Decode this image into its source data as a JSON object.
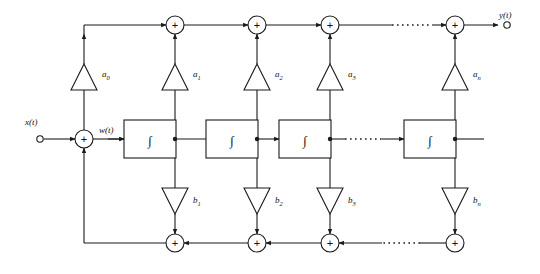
{
  "diagram": {
    "type": "signal-flow-block-diagram",
    "stroke_color": "#1a1a1a",
    "fill_color": "#ffffff",
    "background": "#ffffff",
    "width": 540,
    "height": 274
  },
  "terminals": {
    "input": {
      "label": "x(t)",
      "x": 36,
      "y": 139
    },
    "output": {
      "label": "y(t)",
      "x": 507,
      "y": 25
    },
    "internal": {
      "label": "w(t)",
      "x": 112,
      "y": 132
    }
  },
  "sum_symbol": "+",
  "integrator_symbol": "∫",
  "top_adders": [
    {
      "name": "adder-a0-a1",
      "x": 175,
      "y": 25
    },
    {
      "name": "adder-a1-a2",
      "x": 257,
      "y": 25
    },
    {
      "name": "adder-a2-a3",
      "x": 330,
      "y": 25
    },
    {
      "name": "adder-an",
      "x": 455,
      "y": 25
    }
  ],
  "bottom_adders": [
    {
      "name": "adder-b1",
      "x": 175,
      "y": 243
    },
    {
      "name": "adder-b2",
      "x": 257,
      "y": 243
    },
    {
      "name": "adder-b3",
      "x": 330,
      "y": 243
    },
    {
      "name": "adder-bn",
      "x": 455,
      "y": 243
    }
  ],
  "input_adder": {
    "name": "input-summing-junction",
    "x": 84,
    "y": 139
  },
  "integrators": [
    {
      "name": "integrator-1",
      "x": 150,
      "y": 139,
      "label": "∫"
    },
    {
      "name": "integrator-2",
      "x": 232,
      "y": 139,
      "label": "∫"
    },
    {
      "name": "integrator-3",
      "x": 305,
      "y": 139,
      "label": "∫"
    },
    {
      "name": "integrator-n",
      "x": 430,
      "y": 139,
      "label": "∫"
    }
  ],
  "feedforward_gains": [
    {
      "name": "gain-a0",
      "label": "a",
      "subscript": "0",
      "x": 84,
      "y": 77
    },
    {
      "name": "gain-a1",
      "label": "a",
      "subscript": "1",
      "x": 175,
      "y": 77
    },
    {
      "name": "gain-a2",
      "label": "a",
      "subscript": "2",
      "x": 257,
      "y": 77
    },
    {
      "name": "gain-a3",
      "label": "a",
      "subscript": "3",
      "x": 330,
      "y": 77
    },
    {
      "name": "gain-an",
      "label": "a",
      "subscript": "n",
      "x": 455,
      "y": 77
    }
  ],
  "feedback_gains": [
    {
      "name": "gain-b1",
      "label": "b",
      "subscript": "1",
      "x": 175,
      "y": 201
    },
    {
      "name": "gain-b2",
      "label": "b",
      "subscript": "2",
      "x": 257,
      "y": 201
    },
    {
      "name": "gain-b3",
      "label": "b",
      "subscript": "3",
      "x": 330,
      "y": 201
    },
    {
      "name": "gain-bn",
      "label": "b",
      "subscript": "n",
      "x": 455,
      "y": 201
    }
  ],
  "ellipses": [
    {
      "name": "ellipsis-top-rail",
      "x1": 392,
      "x2": 432,
      "y": 25
    },
    {
      "name": "ellipsis-middle-rail",
      "x1": 345,
      "x2": 382,
      "y": 139
    },
    {
      "name": "ellipsis-bottom-rail",
      "x1": 382,
      "x2": 420,
      "y": 243
    }
  ]
}
